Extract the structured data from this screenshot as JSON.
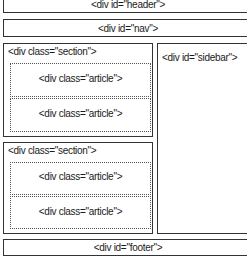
{
  "header": {
    "label": "<div id=\"header\">"
  },
  "nav": {
    "label": "<div id=\"nav\">"
  },
  "sections": [
    {
      "label": "<div class=\"section\">",
      "articles": [
        {
          "label": "<div class=\"article\">"
        },
        {
          "label": "<div class=\"article\">"
        }
      ]
    },
    {
      "label": "<div class=\"section\">",
      "articles": [
        {
          "label": "<div class=\"article\">"
        },
        {
          "label": "<div class=\"article\">"
        }
      ]
    }
  ],
  "sidebar": {
    "label": "<div id=\"sidebar\">"
  },
  "footer": {
    "label": "<div id=\"footer\">"
  }
}
